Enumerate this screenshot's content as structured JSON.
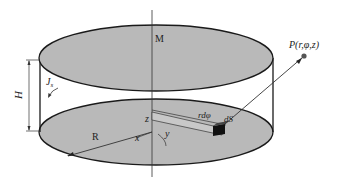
{
  "diagram": {
    "labels": {
      "M": "M",
      "H": "H",
      "Js": "J",
      "Js_sub": "s",
      "R": "R",
      "x": "x",
      "y": "y",
      "z": "z",
      "rdphi": "rdφ",
      "dS": "dS",
      "P": "P(r,φ,z)"
    },
    "colors": {
      "fill": "#b9b9b9",
      "stroke": "#1a1a1a",
      "point": "#555555"
    }
  }
}
